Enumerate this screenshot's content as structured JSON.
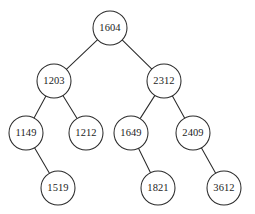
{
  "figure": {
    "background_color": "#ffffff",
    "stroke_color": "#2b2b2b",
    "label_color": "#1c1c1c",
    "node_fill_color": "#ffffff",
    "node_radius": 17
  },
  "chart_data": {
    "type": "diagram",
    "diagram_type": "binary-search-tree",
    "title": "",
    "xlabel": "",
    "ylabel": "",
    "grid": false,
    "legend": null,
    "nodes": [
      {
        "id": "n1604",
        "label": "1604",
        "x": 110,
        "y": 28,
        "depth": 0
      },
      {
        "id": "n1203",
        "label": "1203",
        "x": 54,
        "y": 81,
        "depth": 1
      },
      {
        "id": "n2312",
        "label": "2312",
        "x": 164,
        "y": 81,
        "depth": 1
      },
      {
        "id": "n1149",
        "label": "1149",
        "x": 26,
        "y": 133,
        "depth": 2
      },
      {
        "id": "n1212",
        "label": "1212",
        "x": 86,
        "y": 133,
        "depth": 2
      },
      {
        "id": "n1649",
        "label": "1649",
        "x": 131,
        "y": 133,
        "depth": 2
      },
      {
        "id": "n2409",
        "label": "2409",
        "x": 193,
        "y": 133,
        "depth": 2
      },
      {
        "id": "n1519",
        "label": "1519",
        "x": 58,
        "y": 188,
        "depth": 3
      },
      {
        "id": "n1821",
        "label": "1821",
        "x": 158,
        "y": 188,
        "depth": 3
      },
      {
        "id": "n3612",
        "label": "3612",
        "x": 224,
        "y": 188,
        "depth": 3
      }
    ],
    "edges": [
      {
        "from": "n1604",
        "to": "n1203",
        "side": "left"
      },
      {
        "from": "n1604",
        "to": "n2312",
        "side": "right"
      },
      {
        "from": "n1203",
        "to": "n1149",
        "side": "left"
      },
      {
        "from": "n1203",
        "to": "n1212",
        "side": "right"
      },
      {
        "from": "n2312",
        "to": "n1649",
        "side": "left"
      },
      {
        "from": "n2312",
        "to": "n2409",
        "side": "right"
      },
      {
        "from": "n1149",
        "to": "n1519",
        "side": "right"
      },
      {
        "from": "n1649",
        "to": "n1821",
        "side": "right"
      },
      {
        "from": "n2409",
        "to": "n3612",
        "side": "right"
      }
    ]
  }
}
